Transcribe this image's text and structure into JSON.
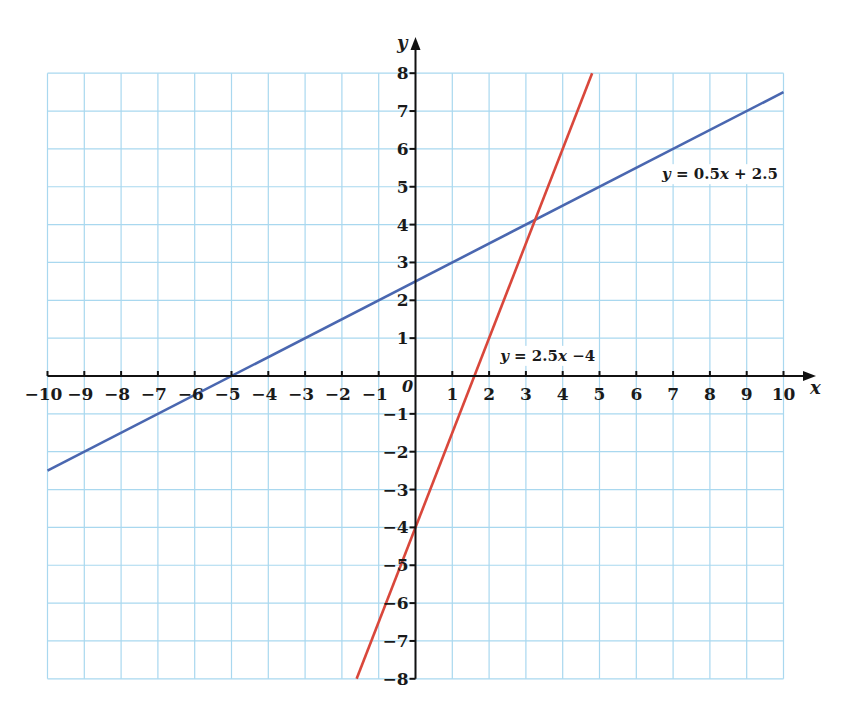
{
  "chart_data": {
    "type": "line",
    "title": "",
    "xlabel": "x",
    "ylabel": "y",
    "origin_label": "0",
    "xlim": [
      -10,
      10
    ],
    "ylim": [
      -8,
      8
    ],
    "grid": true,
    "x_ticks": [
      -10,
      -9,
      -8,
      -7,
      -6,
      -5,
      -4,
      -3,
      -2,
      -1,
      1,
      2,
      3,
      4,
      5,
      6,
      7,
      8,
      9,
      10
    ],
    "y_ticks": [
      -8,
      -7,
      -6,
      -5,
      -4,
      -3,
      -2,
      -1,
      1,
      2,
      3,
      4,
      5,
      6,
      7,
      8
    ],
    "series": [
      {
        "name": "y = 0.5x + 2.5",
        "label_parts": {
          "lhs": "y",
          "rhs": "0.5",
          "var": "x",
          "tail": "+ 2.5"
        },
        "slope": 0.5,
        "intercept": 2.5,
        "color": "#4a67b0",
        "x": [
          -10,
          10
        ],
        "y": [
          -2.5,
          7.5
        ],
        "label_position": {
          "x": 6.7,
          "y": 5.2
        }
      },
      {
        "name": "y = 2.5x − 4",
        "label_parts": {
          "lhs": "y",
          "rhs": "2.5",
          "var": "x",
          "tail": "−4"
        },
        "slope": 2.5,
        "intercept": -4,
        "color": "#d9473b",
        "x": [
          -1.6,
          4.8
        ],
        "y": [
          -8,
          8
        ],
        "label_position": {
          "x": 2.3,
          "y": 0.4
        }
      }
    ],
    "intersection": {
      "x": 3.25,
      "y": 4.125
    }
  },
  "colors": {
    "grid": "#a9d8ef",
    "axis": "#111111",
    "background": "#ffffff"
  }
}
